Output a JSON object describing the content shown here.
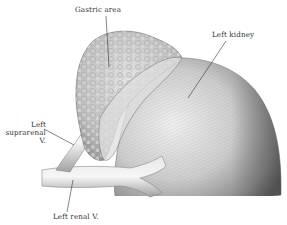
{
  "figure": {
    "labels": {
      "gastric_area": "Gastric area",
      "left_kidney": "Left kidney",
      "left_suprarenal_line1": "Left",
      "left_suprarenal_line2": "suprarenal",
      "left_suprarenal_line3": "V.",
      "left_renal_v": "Left renal V."
    },
    "colors": {
      "background": "#ffffff",
      "ink": "#333333",
      "shade_dark": "#6e6e6e",
      "shade_mid": "#a8a8a8",
      "shade_light": "#e2e2e2"
    }
  }
}
